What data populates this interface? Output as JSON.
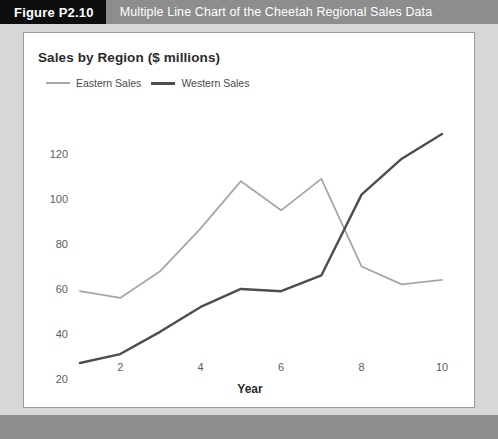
{
  "figure": {
    "badge": "Figure P2.10",
    "caption": "Multiple Line Chart of the Cheetah Regional Sales Data"
  },
  "colors": {
    "header_bar": "#8d8d8d",
    "badge_bg": "#0d0d0d",
    "page_bg": "#d7d7d7",
    "panel_bg": "#ffffff",
    "eastern_series": "#a6a6a6",
    "western_series": "#4d4d4d"
  },
  "chart_data": {
    "type": "line",
    "title": "Sales by Region ($ millions)",
    "xlabel": "Year",
    "ylabel": "",
    "x": [
      1,
      2,
      3,
      4,
      5,
      6,
      7,
      8,
      9,
      10
    ],
    "xlim": [
      1,
      10
    ],
    "ylim": [
      20,
      130
    ],
    "xticks": [
      2,
      4,
      6,
      8,
      10
    ],
    "yticks": [
      20,
      40,
      60,
      80,
      100,
      120
    ],
    "grid": false,
    "legend_position": "top-left",
    "series": [
      {
        "name": "Eastern Sales",
        "color": "#a6a6a6",
        "values": [
          60,
          57,
          69,
          88,
          109,
          96,
          110,
          71,
          63,
          65
        ]
      },
      {
        "name": "Western Sales",
        "color": "#4d4d4d",
        "values": [
          28,
          32,
          42,
          53,
          61,
          60,
          67,
          103,
          119,
          130
        ]
      }
    ]
  }
}
